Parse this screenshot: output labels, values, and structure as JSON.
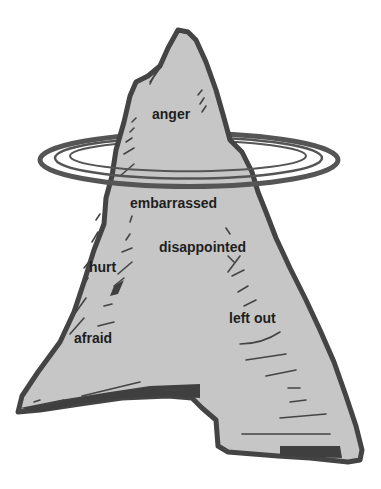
{
  "diagram": {
    "type": "iceberg",
    "colors": {
      "ice_fill": "#c6c6c6",
      "outline": "#444444",
      "text": "#1e1e1e",
      "background": "#ffffff"
    },
    "above_water": [
      {
        "id": "anger",
        "label": "anger",
        "x": 152,
        "y": 107
      }
    ],
    "below_water": [
      {
        "id": "embarrassed",
        "label": "embarrassed",
        "x": 130,
        "y": 196
      },
      {
        "id": "disappointed",
        "label": "disappointed",
        "x": 159,
        "y": 240
      },
      {
        "id": "hurt",
        "label": "hurt",
        "x": 89,
        "y": 260
      },
      {
        "id": "left-out",
        "label": "left out",
        "x": 229,
        "y": 311
      },
      {
        "id": "afraid",
        "label": "afraid",
        "x": 74,
        "y": 331
      }
    ]
  }
}
